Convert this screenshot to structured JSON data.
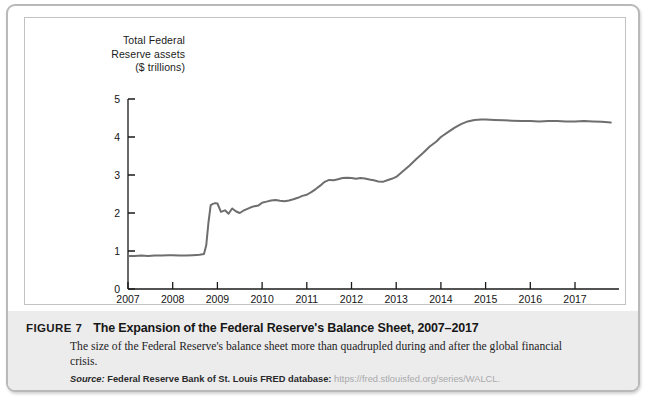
{
  "figure": {
    "label": "FIGURE 7",
    "title": "The Expansion of the Federal Reserve's Balance Sheet, 2007–2017",
    "description": "The size of the Federal Reserve's balance sheet more than quadrupled during and after the global financial crisis.",
    "source_label": "Source:",
    "source_text": "Federal Reserve Bank of St. Louis FRED database:",
    "source_url": "https://fred.stlouisfed.org/series/WALCL."
  },
  "colors": {
    "line": "#6e6e6e",
    "axis": "#1a1a1a",
    "caption_band": "#ececed",
    "card_border": "#b9b9b9",
    "panel_border": "#c3c3c3"
  },
  "chart_data": {
    "type": "line",
    "title": "Total Federal Reserve assets ($ trillions)",
    "axis_title_lines": [
      "Total Federal",
      "Reserve assets",
      "($ trillions)"
    ],
    "xlabel": "",
    "ylabel": "Total Federal Reserve assets ($ trillions)",
    "xlim": [
      2007.0,
      2017.85
    ],
    "ylim": [
      0,
      5
    ],
    "yticks": [
      0,
      1,
      2,
      3,
      4,
      5
    ],
    "ytick_labels": [
      "0",
      "1",
      "2",
      "3",
      "4",
      "5"
    ],
    "xticks": [
      2007,
      2008,
      2009,
      2010,
      2011,
      2012,
      2013,
      2014,
      2015,
      2016,
      2017
    ],
    "xtick_labels": [
      "2007",
      "2008",
      "2009",
      "2010",
      "2011",
      "2012",
      "2013",
      "2014",
      "2015",
      "2016",
      "2017"
    ],
    "grid": false,
    "legend": false,
    "series": [
      {
        "name": "Total Federal Reserve assets",
        "units": "$ trillions",
        "x": [
          2007.0,
          2007.15,
          2007.3,
          2007.45,
          2007.6,
          2007.75,
          2007.9,
          2008.0,
          2008.15,
          2008.3,
          2008.45,
          2008.6,
          2008.7,
          2008.75,
          2008.8,
          2008.85,
          2008.9,
          2008.95,
          2009.0,
          2009.08,
          2009.17,
          2009.25,
          2009.33,
          2009.42,
          2009.5,
          2009.58,
          2009.67,
          2009.75,
          2009.83,
          2009.92,
          2010.0,
          2010.1,
          2010.2,
          2010.3,
          2010.4,
          2010.5,
          2010.6,
          2010.7,
          2010.8,
          2010.9,
          2011.0,
          2011.1,
          2011.2,
          2011.3,
          2011.4,
          2011.5,
          2011.6,
          2011.7,
          2011.8,
          2011.9,
          2012.0,
          2012.1,
          2012.2,
          2012.3,
          2012.4,
          2012.5,
          2012.6,
          2012.7,
          2012.8,
          2012.9,
          2013.0,
          2013.15,
          2013.3,
          2013.45,
          2013.6,
          2013.75,
          2013.9,
          2014.0,
          2014.15,
          2014.3,
          2014.45,
          2014.6,
          2014.75,
          2014.9,
          2015.0,
          2015.2,
          2015.4,
          2015.6,
          2015.8,
          2016.0,
          2016.2,
          2016.4,
          2016.6,
          2016.8,
          2017.0,
          2017.2,
          2017.4,
          2017.6,
          2017.8
        ],
        "y": [
          0.87,
          0.87,
          0.88,
          0.87,
          0.88,
          0.88,
          0.89,
          0.89,
          0.88,
          0.88,
          0.89,
          0.9,
          0.92,
          1.15,
          1.75,
          2.21,
          2.24,
          2.26,
          2.25,
          2.03,
          2.07,
          1.98,
          2.12,
          2.04,
          2.0,
          2.06,
          2.11,
          2.15,
          2.18,
          2.2,
          2.27,
          2.3,
          2.33,
          2.34,
          2.32,
          2.31,
          2.33,
          2.36,
          2.4,
          2.45,
          2.48,
          2.55,
          2.63,
          2.72,
          2.82,
          2.87,
          2.86,
          2.89,
          2.92,
          2.93,
          2.92,
          2.9,
          2.92,
          2.91,
          2.88,
          2.86,
          2.83,
          2.82,
          2.86,
          2.9,
          2.95,
          3.1,
          3.25,
          3.42,
          3.58,
          3.75,
          3.88,
          4.0,
          4.12,
          4.24,
          4.34,
          4.41,
          4.45,
          4.46,
          4.46,
          4.45,
          4.44,
          4.43,
          4.42,
          4.42,
          4.41,
          4.42,
          4.42,
          4.41,
          4.41,
          4.42,
          4.41,
          4.4,
          4.38
        ]
      }
    ],
    "annotations": [
      {
        "text": "flat near $0.87 trillion through mid-2008"
      },
      {
        "text": "sharp spike to about $2.2 trillion in late 2008"
      },
      {
        "text": "plateau near $2.9 trillion during 2011–2012"
      },
      {
        "text": "rise to about $4.45 trillion by 2015, flat thereafter"
      }
    ]
  }
}
